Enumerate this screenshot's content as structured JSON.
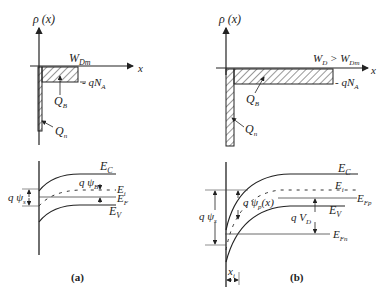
{
  "diagram": {
    "panel_a": {
      "caption": "(a)",
      "charge": {
        "y_axis": "ρ (x)",
        "x_axis": "x",
        "width_label": "W",
        "width_sub": "Dm",
        "qna_label": "- qN",
        "qna_sub": "A",
        "qb_label": "Q",
        "qb_sub": "B",
        "qn_label": "Q",
        "qn_sub": "n"
      },
      "bands": {
        "ec_label": "E",
        "ec_sub": "C",
        "ei_label": "E",
        "ei_sub": "i",
        "ef_label": "E",
        "ef_sub": "F",
        "ev_label": "E",
        "ev_sub": "V",
        "psis_label": "q ψ",
        "psis_sub": "s",
        "psib_label": "q ψ",
        "psib_sub": "B"
      }
    },
    "panel_b": {
      "caption": "(b)",
      "charge": {
        "y_axis": "ρ (x)",
        "x_axis": "x",
        "width_label": "W",
        "width_sub1": "D",
        "width_gt": " > W",
        "width_sub2": "Dm",
        "qna_label": "- qN",
        "qna_sub": "A",
        "qb_label": "Q",
        "qb_sub": "B",
        "qn_label": "Q",
        "qn_sub": "n"
      },
      "bands": {
        "ec_label": "E",
        "ec_sub": "C",
        "ei_label": "E",
        "ei_sub": "i",
        "efp_label": "E",
        "efp_sub": "Fp",
        "ev_label": "E",
        "ev_sub": "V",
        "efn_label": "E",
        "efn_sub": "Fn",
        "psis_label": "q ψ",
        "psis_sub": "s",
        "psip_label": "q ψ",
        "psip_sub": "p",
        "psip_arg": "(x)",
        "vd_label": "q V",
        "vd_sub": "D",
        "xi_label": "x",
        "xi_sub": "i"
      }
    }
  }
}
